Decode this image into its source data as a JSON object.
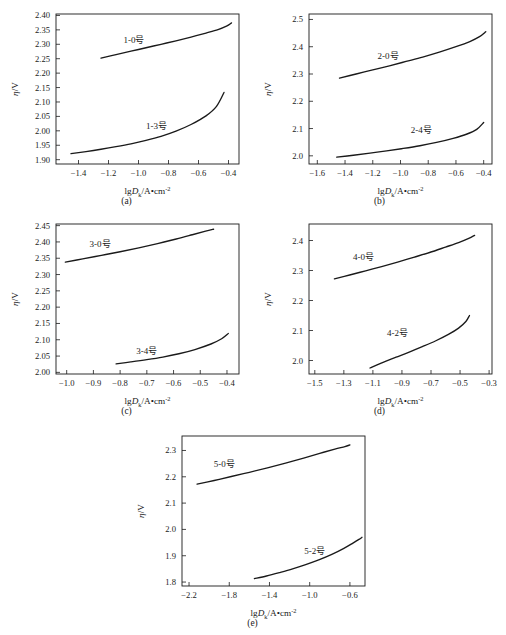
{
  "figure": {
    "axis_x_label_parts": {
      "lg": "lg",
      "d": "D",
      "k": "k",
      "units": "/A•cm",
      "exp": "-2"
    },
    "axis_y_label_parts": {
      "eta": "η",
      "slash_v": "/V"
    }
  },
  "chart_data": [
    {
      "type": "line",
      "panel": "a",
      "caption": "(a)",
      "title": "",
      "xlabel": "lgDk/A•cm-2",
      "ylabel": "η/V",
      "xlim": [
        -1.55,
        -0.33
      ],
      "ylim": [
        1.885,
        2.405
      ],
      "xticks": [
        -1.4,
        -1.2,
        -1.0,
        -0.8,
        -0.6,
        -0.4
      ],
      "xticklabels": [
        "−1.4",
        "−1.2",
        "−1.0",
        "−0.8",
        "−0.6",
        "−0.4"
      ],
      "yticks": [
        1.9,
        1.95,
        2.0,
        2.05,
        2.1,
        2.15,
        2.2,
        2.25,
        2.3,
        2.35,
        2.4
      ],
      "yticklabels": [
        "1.90",
        "1.95",
        "2.00",
        "2.05",
        "2.10",
        "2.15",
        "2.20",
        "2.25",
        "2.30",
        "2.35",
        "2.40"
      ],
      "grid": false,
      "legend": "none",
      "series": [
        {
          "name": "1-0号",
          "label_x": -1.03,
          "label_y": 2.305,
          "x": [
            -1.25,
            -1.15,
            -1.05,
            -0.95,
            -0.85,
            -0.75,
            -0.65,
            -0.55,
            -0.47,
            -0.41,
            -0.38
          ],
          "y": [
            2.252,
            2.264,
            2.276,
            2.288,
            2.3,
            2.312,
            2.325,
            2.339,
            2.351,
            2.364,
            2.374
          ]
        },
        {
          "name": "1-3号",
          "label_x": -0.88,
          "label_y": 2.005,
          "x": [
            -1.45,
            -1.35,
            -1.25,
            -1.15,
            -1.05,
            -0.95,
            -0.85,
            -0.75,
            -0.65,
            -0.55,
            -0.48,
            -0.43
          ],
          "y": [
            1.921,
            1.928,
            1.936,
            1.945,
            1.955,
            1.967,
            1.981,
            1.999,
            2.022,
            2.052,
            2.085,
            2.133
          ]
        }
      ]
    },
    {
      "type": "line",
      "panel": "b",
      "caption": "(b)",
      "title": "",
      "xlabel": "lgDk/A•cm-2",
      "ylabel": "η/V",
      "xlim": [
        -1.66,
        -0.34
      ],
      "ylim": [
        1.97,
        2.52
      ],
      "xticks": [
        -1.6,
        -1.4,
        -1.2,
        -1.0,
        -0.8,
        -0.6,
        -0.4
      ],
      "xticklabels": [
        "−1.6",
        "−1.4",
        "−1.2",
        "−1.0",
        "−0.8",
        "−0.6",
        "−0.4"
      ],
      "yticks": [
        2.0,
        2.1,
        2.2,
        2.3,
        2.4,
        2.5
      ],
      "yticklabels": [
        "2.0",
        "2.1",
        "2.2",
        "2.3",
        "2.4",
        "2.5"
      ],
      "grid": false,
      "legend": "none",
      "series": [
        {
          "name": "2-0号",
          "label_x": -1.09,
          "label_y": 2.355,
          "x": [
            -1.44,
            -1.32,
            -1.2,
            -1.08,
            -0.96,
            -0.84,
            -0.72,
            -0.6,
            -0.5,
            -0.43,
            -0.385
          ],
          "y": [
            2.285,
            2.3,
            2.315,
            2.33,
            2.346,
            2.362,
            2.38,
            2.4,
            2.419,
            2.437,
            2.455
          ]
        },
        {
          "name": "2-4号",
          "label_x": -0.85,
          "label_y": 2.083,
          "x": [
            -1.46,
            -1.34,
            -1.22,
            -1.1,
            -0.98,
            -0.86,
            -0.74,
            -0.62,
            -0.52,
            -0.45,
            -0.4
          ],
          "y": [
            1.995,
            2.002,
            2.01,
            2.018,
            2.027,
            2.037,
            2.049,
            2.064,
            2.08,
            2.097,
            2.122
          ]
        }
      ]
    },
    {
      "type": "line",
      "panel": "c",
      "caption": "(c)",
      "title": "",
      "xlabel": "lgDk/A•cm-2",
      "ylabel": "η/V",
      "xlim": [
        -1.04,
        -0.355
      ],
      "ylim": [
        1.995,
        2.455
      ],
      "xticks": [
        -1.0,
        -0.9,
        -0.8,
        -0.7,
        -0.6,
        -0.5,
        -0.4
      ],
      "xticklabels": [
        "−1.0",
        "−0.9",
        "−0.8",
        "−0.7",
        "−0.6",
        "−0.5",
        "−0.4"
      ],
      "yticks": [
        2.0,
        2.05,
        2.1,
        2.15,
        2.2,
        2.25,
        2.3,
        2.35,
        2.4,
        2.45
      ],
      "yticklabels": [
        "2.00",
        "2.05",
        "2.10",
        "2.15",
        "2.20",
        "2.25",
        "2.30",
        "2.35",
        "2.40",
        "2.45"
      ],
      "grid": false,
      "legend": "none",
      "series": [
        {
          "name": "3-0号",
          "label_x": -0.875,
          "label_y": 2.383,
          "x": [
            -1.005,
            -0.94,
            -0.87,
            -0.8,
            -0.73,
            -0.66,
            -0.59,
            -0.53,
            -0.48,
            -0.45
          ],
          "y": [
            2.338,
            2.348,
            2.359,
            2.37,
            2.382,
            2.395,
            2.409,
            2.422,
            2.433,
            2.439
          ]
        },
        {
          "name": "3-4号",
          "label_x": -0.7,
          "label_y": 2.057,
          "x": [
            -0.815,
            -0.76,
            -0.7,
            -0.64,
            -0.58,
            -0.52,
            -0.46,
            -0.42,
            -0.395
          ],
          "y": [
            2.026,
            2.032,
            2.039,
            2.047,
            2.057,
            2.07,
            2.087,
            2.103,
            2.119
          ]
        }
      ]
    },
    {
      "type": "line",
      "panel": "d",
      "caption": "(d)",
      "title": "",
      "xlabel": "lgDk/A•cm-2",
      "ylabel": "η/V",
      "xlim": [
        -1.54,
        -0.28
      ],
      "ylim": [
        1.955,
        2.455
      ],
      "xticks": [
        -1.5,
        -1.3,
        -1.1,
        -0.9,
        -0.7,
        -0.5,
        -0.3
      ],
      "xticklabels": [
        "−1.5",
        "−1.3",
        "−1.1",
        "−0.9",
        "−0.7",
        "−0.5",
        "−0.3"
      ],
      "yticks": [
        2.0,
        2.1,
        2.2,
        2.3,
        2.4
      ],
      "yticklabels": [
        "2.0",
        "2.1",
        "2.2",
        "2.3",
        "2.4"
      ],
      "grid": false,
      "legend": "none",
      "series": [
        {
          "name": "4-0号",
          "label_x": -1.165,
          "label_y": 2.335,
          "x": [
            -1.365,
            -1.26,
            -1.15,
            -1.04,
            -0.93,
            -0.82,
            -0.71,
            -0.6,
            -0.51,
            -0.44,
            -0.4
          ],
          "y": [
            2.272,
            2.285,
            2.299,
            2.313,
            2.328,
            2.344,
            2.36,
            2.378,
            2.393,
            2.407,
            2.417
          ]
        },
        {
          "name": "4-2号",
          "label_x": -0.93,
          "label_y": 2.082,
          "x": [
            -1.12,
            -1.03,
            -0.94,
            -0.85,
            -0.76,
            -0.67,
            -0.58,
            -0.51,
            -0.46,
            -0.435
          ],
          "y": [
            1.975,
            1.994,
            2.011,
            2.028,
            2.046,
            2.065,
            2.087,
            2.108,
            2.13,
            2.15
          ]
        }
      ]
    },
    {
      "type": "line",
      "panel": "e",
      "caption": "(e)",
      "title": "",
      "xlabel": "lgDk/A•cm-2",
      "ylabel": "η/V",
      "xlim": [
        -2.27,
        -0.45
      ],
      "ylim": [
        1.785,
        2.355
      ],
      "xticks": [
        -2.2,
        -1.8,
        -1.4,
        -1.0,
        -0.6
      ],
      "xticklabels": [
        "−2.2",
        "−1.8",
        "−1.4",
        "−1.0",
        "−0.6"
      ],
      "yticks": [
        1.8,
        1.9,
        2.0,
        2.1,
        2.2,
        2.3
      ],
      "yticklabels": [
        "1.8",
        "1.9",
        "2.0",
        "2.1",
        "2.2",
        "2.3"
      ],
      "grid": false,
      "legend": "none",
      "series": [
        {
          "name": "5-0号",
          "label_x": -1.85,
          "label_y": 2.238,
          "x": [
            -2.12,
            -1.95,
            -1.78,
            -1.6,
            -1.42,
            -1.24,
            -1.06,
            -0.9,
            -0.75,
            -0.65,
            -0.6
          ],
          "y": [
            2.172,
            2.186,
            2.201,
            2.217,
            2.234,
            2.252,
            2.271,
            2.289,
            2.305,
            2.315,
            2.321
          ]
        },
        {
          "name": "5-2号",
          "label_x": -0.95,
          "label_y": 1.905,
          "x": [
            -1.55,
            -1.43,
            -1.3,
            -1.17,
            -1.04,
            -0.91,
            -0.78,
            -0.66,
            -0.57,
            -0.51,
            -0.48
          ],
          "y": [
            1.813,
            1.823,
            1.836,
            1.85,
            1.866,
            1.884,
            1.905,
            1.928,
            1.948,
            1.962,
            1.97
          ]
        }
      ]
    }
  ]
}
